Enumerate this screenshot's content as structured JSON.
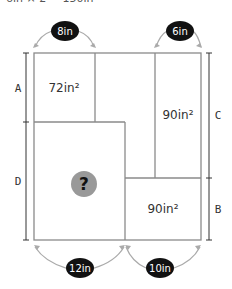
{
  "caption": "6in × 2 = 150in",
  "dimensions": {
    "top_left": "8in",
    "top_right": "6in",
    "bottom_left": "12in",
    "bottom_right": "10in"
  },
  "areas": {
    "top_left": "72in²",
    "right_tall": "90in²",
    "bottom_right": "90in²",
    "unknown": "?"
  },
  "side_labels": {
    "left_top": "A",
    "left_bottom": "D",
    "right_top": "C",
    "right_bottom": "B"
  },
  "colors": {
    "line": "#8a8a8a",
    "badge": "#111111",
    "question_circle": "#999999",
    "arrow": "#aaaaaa"
  }
}
